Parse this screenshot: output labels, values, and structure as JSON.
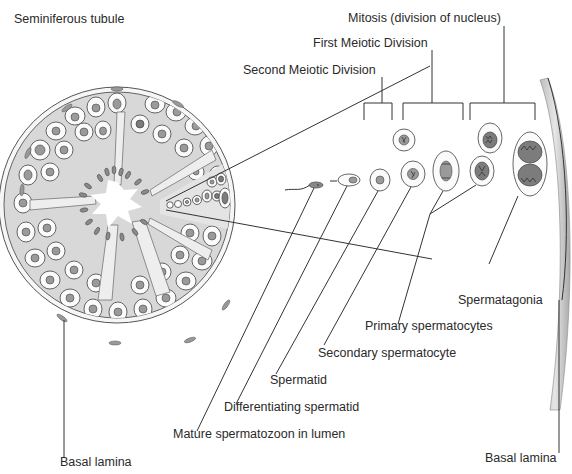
{
  "figure": {
    "title": "Seminiferous tubule",
    "groups": {
      "mitosis": "Mitosis (division of nucleus)",
      "first_meiotic": "First Meiotic Division",
      "second_meiotic": "Second Meiotic Division"
    },
    "cell_labels": {
      "spermatagonia": "Spermatagonia",
      "primary_spermatocytes": "Primary spermatocytes",
      "secondary_spermatocyte": "Secondary spermatocyte",
      "spermatid": "Spermatid",
      "differentiating_spermatid": "Differentiating spermatid",
      "mature_spermatozoon": "Mature spermatozoon in lumen"
    },
    "basal_lamina_left": "Basal lamina",
    "basal_lamina_right": "Basal lamina",
    "colors": {
      "line": "#333333",
      "cytoplasm_fill": "#d8d8d8",
      "nucleus_fill": "#9a9a9a",
      "background": "#ffffff"
    }
  }
}
